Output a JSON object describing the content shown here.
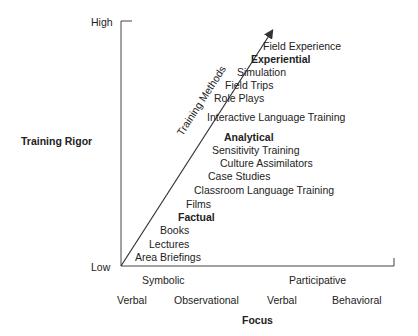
{
  "y_axis": {
    "label": "Training Rigor",
    "high": "High",
    "low": "Low"
  },
  "x_axis": {
    "label": "Focus",
    "groups": [
      "Symbolic",
      "Participative"
    ],
    "subgroups": [
      "Verbal",
      "Observational",
      "Verbal",
      "Behavioral"
    ]
  },
  "arrow_label": "Training Methods",
  "methods": [
    {
      "label": "Field Experience",
      "bold": false
    },
    {
      "label": "Experiential",
      "bold": true
    },
    {
      "label": "Simulation",
      "bold": false
    },
    {
      "label": "Field Trips",
      "bold": false
    },
    {
      "label": "Role Plays",
      "bold": false
    },
    {
      "label": "Interactive Language Training",
      "bold": false
    },
    {
      "label": "Analytical",
      "bold": true
    },
    {
      "label": "Sensitivity Training",
      "bold": false
    },
    {
      "label": "Culture Assimilators",
      "bold": false
    },
    {
      "label": "Case Studies",
      "bold": false
    },
    {
      "label": "Classroom Language Training",
      "bold": false
    },
    {
      "label": "Films",
      "bold": false
    },
    {
      "label": "Factual",
      "bold": true
    },
    {
      "label": "Books",
      "bold": false
    },
    {
      "label": "Lectures",
      "bold": false
    },
    {
      "label": "Area Briefings",
      "bold": false
    }
  ]
}
